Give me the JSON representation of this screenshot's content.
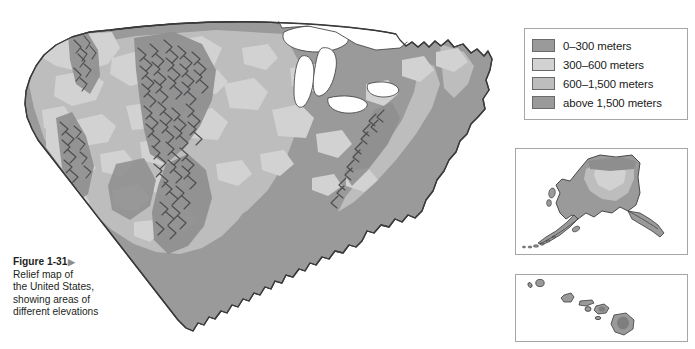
{
  "figure": {
    "number": "Figure 1-31",
    "arrow_icon": "▶",
    "caption_lines": [
      "Relief map of",
      "the United States,",
      "showing areas of",
      "different elevations"
    ]
  },
  "legend": {
    "items": [
      {
        "label": "0–300 meters",
        "color": "#9a9a9a",
        "elevation_min": 0,
        "elevation_max": 300
      },
      {
        "label": "300–600 meters",
        "color": "#d2d2d2",
        "elevation_min": 300,
        "elevation_max": 600
      },
      {
        "label": "600–1,500 meters",
        "color": "#bdbdbd",
        "elevation_min": 600,
        "elevation_max": 1500
      },
      {
        "label": "above 1,500 meters",
        "color": "#9a9a9a",
        "elevation_min": 1500,
        "elevation_max": null
      }
    ]
  },
  "map": {
    "title": "Relief map of the United States",
    "main_region": "Contiguous United States",
    "insets": [
      {
        "name": "Alaska"
      },
      {
        "name": "Hawaii"
      }
    ],
    "water_color": "#ffffff",
    "coastline_color": "#3a3a3a",
    "hachure_color": "#4e4e52",
    "mountain_ranges": [
      "Cascade Range",
      "Sierra Nevada",
      "Rocky Mountains",
      "Appalachian Mountains"
    ],
    "water_bodies": [
      "Great Lakes",
      "Atlantic Ocean",
      "Pacific Ocean",
      "Gulf of Mexico"
    ]
  }
}
